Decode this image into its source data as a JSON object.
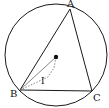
{
  "diagram": {
    "type": "geometry",
    "circle": {
      "cx": 56,
      "cy": 55,
      "r": 51
    },
    "center_dot": {
      "x": 56,
      "y": 57
    },
    "points": {
      "A": {
        "label": "A",
        "x": 70,
        "y": 9
      },
      "B": {
        "label": "B",
        "x": 20,
        "y": 90
      },
      "C": {
        "label": "C",
        "x": 92,
        "y": 91
      },
      "I": {
        "label": "I",
        "x": 48,
        "y": 75
      }
    },
    "labels": {
      "A": "A",
      "B": "B",
      "C": "C",
      "I": "I"
    },
    "colors": {
      "stroke": "#1a1a1a",
      "dashed": "#555555",
      "background": "#ffffff"
    }
  }
}
